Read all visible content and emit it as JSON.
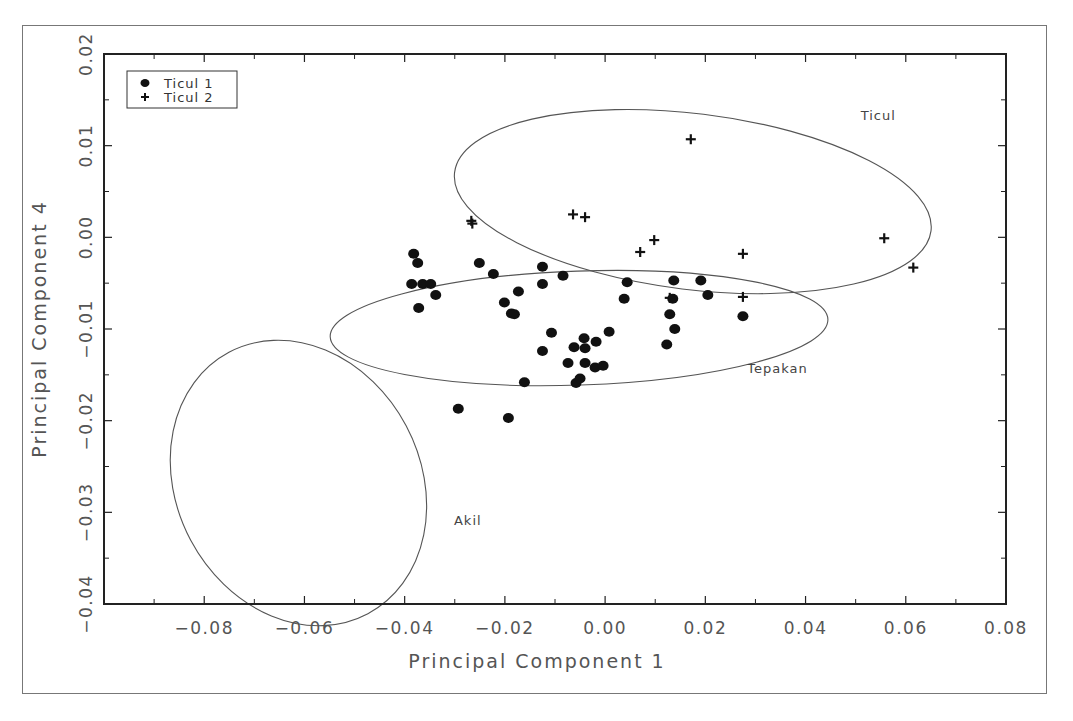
{
  "chart_data": {
    "type": "scatter",
    "title": "",
    "xlabel": "Principal Component 1",
    "ylabel": "Principal Component 4",
    "xlim": [
      -0.1,
      0.08
    ],
    "ylim": [
      -0.04,
      0.02
    ],
    "x_ticks": [
      "-0.08",
      "-0.06",
      "-0.04",
      "-0.02",
      "0.00",
      "0.02",
      "0.04",
      "0.06",
      "0.08"
    ],
    "y_ticks": [
      "-0.04",
      "-0.03",
      "-0.02",
      "-0.01",
      "0.00",
      "0.01",
      "0.02"
    ],
    "grid": false,
    "legend_position": "upper-left",
    "series": [
      {
        "name": "Ticul 1",
        "marker": "filled-circle",
        "points": [
          [
            -0.0382,
            -0.0018
          ],
          [
            -0.0374,
            -0.0028
          ],
          [
            -0.0386,
            -0.0051
          ],
          [
            -0.0364,
            -0.0051
          ],
          [
            -0.0348,
            -0.0051
          ],
          [
            -0.0338,
            -0.0063
          ],
          [
            -0.0372,
            -0.0077
          ],
          [
            -0.0251,
            -0.0028
          ],
          [
            -0.0223,
            -0.004
          ],
          [
            -0.0201,
            -0.0071
          ],
          [
            -0.0187,
            -0.0083
          ],
          [
            -0.0181,
            -0.0084
          ],
          [
            -0.0173,
            -0.0059
          ],
          [
            -0.0125,
            -0.0032
          ],
          [
            -0.0125,
            -0.0051
          ],
          [
            -0.0084,
            -0.0042
          ],
          [
            -0.0107,
            -0.0104
          ],
          [
            -0.0125,
            -0.0124
          ],
          [
            -0.0074,
            -0.0137
          ],
          [
            -0.0062,
            -0.012
          ],
          [
            -0.0058,
            -0.0159
          ],
          [
            -0.005,
            -0.0154
          ],
          [
            -0.0042,
            -0.011
          ],
          [
            -0.004,
            -0.0121
          ],
          [
            -0.004,
            -0.0137
          ],
          [
            -0.0018,
            -0.0114
          ],
          [
            -0.002,
            -0.0142
          ],
          [
            -0.0004,
            -0.014
          ],
          [
            0.0008,
            -0.0103
          ],
          [
            -0.0161,
            -0.0158
          ],
          [
            -0.0293,
            -0.0187
          ],
          [
            -0.0193,
            -0.0197
          ],
          [
            0.0044,
            -0.0049
          ],
          [
            0.0038,
            -0.0067
          ],
          [
            0.0137,
            -0.0047
          ],
          [
            0.0135,
            -0.0067
          ],
          [
            0.0129,
            -0.0084
          ],
          [
            0.0139,
            -0.01
          ],
          [
            0.0123,
            -0.0117
          ],
          [
            0.0191,
            -0.0047
          ],
          [
            0.0205,
            -0.0063
          ],
          [
            0.0275,
            -0.0086
          ]
        ]
      },
      {
        "name": "Ticul 2",
        "marker": "plus",
        "points": [
          [
            -0.0267,
            0.0018
          ],
          [
            -0.0265,
            0.0015
          ],
          [
            -0.0064,
            0.0025
          ],
          [
            -0.004,
            0.0022
          ],
          [
            0.007,
            -0.0016
          ],
          [
            0.0098,
            -0.0003
          ],
          [
            0.0171,
            0.0107
          ],
          [
            0.0275,
            -0.0018
          ],
          [
            0.0557,
            -0.0001
          ],
          [
            0.0615,
            -0.0033
          ],
          [
            0.0275,
            -0.0065
          ],
          [
            0.0129,
            -0.0066
          ]
        ]
      }
    ],
    "ellipses": [
      {
        "label": "Ticul",
        "cx": 0.0175,
        "cy": 0.0039,
        "rx_px": 240,
        "ry_px": 88,
        "rotate_deg": 7,
        "label_pos": [
          0.0545,
          0.0128
        ]
      },
      {
        "label": "Tepakan",
        "cx": -0.0052,
        "cy": -0.0099,
        "rx_px": 249,
        "ry_px": 57,
        "rotate_deg": -2,
        "label_pos": [
          0.0344,
          -0.0148
        ]
      },
      {
        "label": "Akil",
        "cx": -0.0612,
        "cy": -0.0268,
        "rx_px": 148,
        "ry_px": 122,
        "rotate_deg": 62,
        "label_pos": [
          -0.0274,
          -0.0314
        ]
      }
    ]
  }
}
